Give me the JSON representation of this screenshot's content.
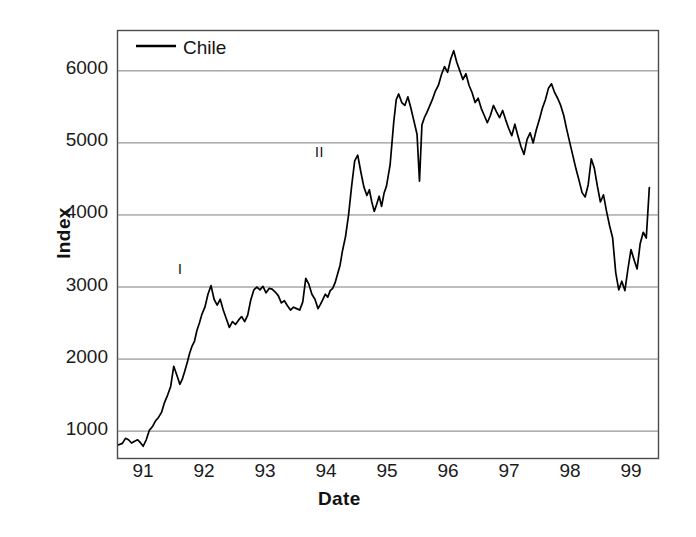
{
  "chart_data": {
    "type": "line",
    "title": "",
    "xlabel": "Date",
    "ylabel": "Index",
    "xlim": [
      90.6,
      99.45
    ],
    "ylim": [
      620,
      6560
    ],
    "grid": true,
    "grid_axis": "y",
    "legend": {
      "position": "top-left-inside",
      "entries": [
        {
          "name": "Chile",
          "color": "#000000",
          "marker": "line"
        }
      ]
    },
    "yticks": [
      1000,
      2000,
      3000,
      4000,
      5000,
      6000
    ],
    "ytick_labels": [
      "1000",
      "2000",
      "3000",
      "4000",
      "5000",
      "6000"
    ],
    "xticks": [
      91,
      92,
      93,
      94,
      95,
      96,
      97,
      98,
      99
    ],
    "xtick_labels": [
      "91",
      "92",
      "93",
      "94",
      "95",
      "96",
      "97",
      "98",
      "99"
    ],
    "annotations": [
      {
        "text": "I",
        "x": 91.68,
        "y": 3240,
        "note": "first marked episode"
      },
      {
        "text": "II",
        "x": 94.05,
        "y": 5020,
        "note": "second marked episode"
      }
    ],
    "series": [
      {
        "name": "Chile",
        "color": "#000000",
        "x": [
          90.62,
          90.68,
          90.73,
          90.78,
          90.83,
          90.88,
          90.93,
          90.97,
          91.02,
          91.07,
          91.12,
          91.17,
          91.22,
          91.27,
          91.32,
          91.37,
          91.42,
          91.47,
          91.52,
          91.57,
          91.62,
          91.66,
          91.7,
          91.74,
          91.78,
          91.82,
          91.86,
          91.9,
          91.94,
          91.98,
          92.03,
          92.08,
          92.13,
          92.18,
          92.23,
          92.28,
          92.33,
          92.38,
          92.43,
          92.48,
          92.53,
          92.58,
          92.63,
          92.68,
          92.73,
          92.78,
          92.83,
          92.88,
          92.93,
          92.98,
          93.03,
          93.08,
          93.13,
          93.18,
          93.23,
          93.28,
          93.33,
          93.38,
          93.43,
          93.48,
          93.53,
          93.58,
          93.63,
          93.68,
          93.73,
          93.78,
          93.83,
          93.88,
          93.92,
          93.96,
          94.0,
          94.04,
          94.08,
          94.12,
          94.16,
          94.2,
          94.24,
          94.28,
          94.33,
          94.38,
          94.43,
          94.48,
          94.53,
          94.58,
          94.63,
          94.68,
          94.72,
          94.76,
          94.8,
          94.84,
          94.88,
          94.92,
          94.96,
          95.0,
          95.03,
          95.06,
          95.09,
          95.12,
          95.16,
          95.2,
          95.25,
          95.3,
          95.35,
          95.4,
          95.45,
          95.5,
          95.54,
          95.58,
          95.62,
          95.66,
          95.7,
          95.75,
          95.8,
          95.85,
          95.9,
          95.95,
          96.0,
          96.05,
          96.1,
          96.15,
          96.2,
          96.25,
          96.3,
          96.35,
          96.4,
          96.45,
          96.5,
          96.55,
          96.6,
          96.65,
          96.7,
          96.75,
          96.8,
          96.85,
          96.9,
          96.95,
          97.0,
          97.05,
          97.1,
          97.15,
          97.2,
          97.25,
          97.3,
          97.35,
          97.4,
          97.45,
          97.5,
          97.55,
          97.6,
          97.65,
          97.7,
          97.75,
          97.8,
          97.85,
          97.9,
          97.95,
          98.0,
          98.05,
          98.1,
          98.15,
          98.2,
          98.25,
          98.3,
          98.35,
          98.4,
          98.45,
          98.5,
          98.55,
          98.6,
          98.65,
          98.7,
          98.75,
          98.8,
          98.85,
          98.9,
          98.95,
          99.0,
          99.05,
          99.1,
          99.15,
          99.2,
          99.25,
          99.3
        ],
        "y": [
          810,
          830,
          900,
          880,
          835,
          860,
          880,
          845,
          790,
          880,
          1010,
          1060,
          1140,
          1190,
          1260,
          1400,
          1500,
          1620,
          1900,
          1780,
          1650,
          1720,
          1830,
          1950,
          2080,
          2180,
          2250,
          2400,
          2500,
          2620,
          2720,
          2900,
          3020,
          2830,
          2750,
          2830,
          2680,
          2560,
          2440,
          2520,
          2480,
          2540,
          2590,
          2520,
          2610,
          2820,
          2960,
          3000,
          2960,
          3010,
          2920,
          2980,
          2970,
          2930,
          2880,
          2780,
          2810,
          2740,
          2680,
          2720,
          2700,
          2680,
          2790,
          3120,
          3040,
          2900,
          2830,
          2700,
          2760,
          2830,
          2900,
          2860,
          2950,
          2980,
          3060,
          3180,
          3300,
          3500,
          3700,
          4000,
          4400,
          4750,
          4830,
          4600,
          4390,
          4270,
          4350,
          4180,
          4050,
          4150,
          4260,
          4120,
          4300,
          4400,
          4550,
          4700,
          5000,
          5300,
          5600,
          5680,
          5560,
          5520,
          5640,
          5480,
          5300,
          5120,
          4470,
          5250,
          5350,
          5420,
          5500,
          5600,
          5720,
          5800,
          5950,
          6060,
          5980,
          6160,
          6280,
          6120,
          6000,
          5880,
          5960,
          5800,
          5700,
          5560,
          5620,
          5480,
          5380,
          5280,
          5380,
          5520,
          5430,
          5350,
          5450,
          5320,
          5200,
          5100,
          5260,
          5100,
          4950,
          4840,
          5050,
          5140,
          5000,
          5180,
          5320,
          5480,
          5600,
          5760,
          5820,
          5700,
          5620,
          5520,
          5380,
          5180,
          5000,
          4820,
          4640,
          4480,
          4310,
          4250,
          4420,
          4780,
          4650,
          4400,
          4180,
          4280,
          4050,
          3850,
          3680,
          3200,
          2960,
          3080,
          2950,
          3250,
          3520,
          3380,
          3250,
          3600,
          3760,
          3680,
          4380
        ]
      }
    ]
  },
  "axis_labels": {
    "x_title": "Date",
    "y_title": "Index"
  },
  "legend_label": "Chile"
}
